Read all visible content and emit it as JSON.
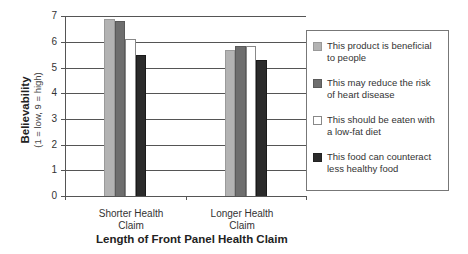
{
  "chart_data": {
    "type": "bar",
    "title": "",
    "xlabel": "Length of Front Panel Health Claim",
    "ylabel": "Believability",
    "ylabel_sub": "(1 = low, 9 = high)",
    "ylim": [
      0,
      7
    ],
    "yticks": [
      0,
      1,
      2,
      3,
      4,
      5,
      6,
      7
    ],
    "grid": true,
    "legend_position": "right",
    "categories": [
      "Shorter Health Claim",
      "Longer Health Claim"
    ],
    "category_labels": [
      [
        "Shorter Health",
        "Claim"
      ],
      [
        "Longer Health",
        "Claim"
      ]
    ],
    "series": [
      {
        "name": "This product is beneficial to people",
        "values": [
          6.9,
          5.7
        ],
        "color": "#b3b3b3"
      },
      {
        "name": "This may reduce the risk of heart disease",
        "values": [
          6.8,
          5.85
        ],
        "color": "#6e6e6e"
      },
      {
        "name": "This should be eaten with a low-fat diet",
        "values": [
          6.1,
          5.85
        ],
        "color": "#ffffff"
      },
      {
        "name": "This food can counteract less healthy food",
        "values": [
          5.5,
          5.3
        ],
        "color": "#2b2b2b"
      }
    ]
  },
  "legend": {
    "items": [
      {
        "line1": "This product is beneficial",
        "line2": "to people"
      },
      {
        "line1": "This may reduce the risk",
        "line2": "of heart disease"
      },
      {
        "line1": "This should be eaten with",
        "line2": "a low-fat diet"
      },
      {
        "line1": "This food can counteract",
        "line2": "less healthy food"
      }
    ]
  }
}
